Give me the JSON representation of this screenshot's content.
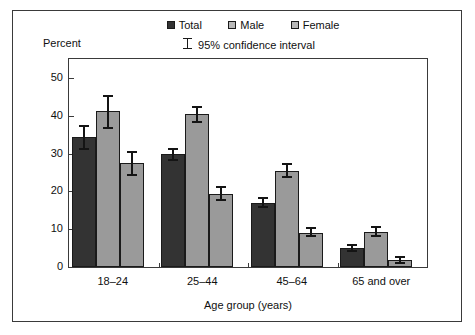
{
  "chart_data": {
    "type": "bar",
    "title": "",
    "xlabel": "Age group (years)",
    "ylabel": "Percent",
    "ylim": [
      0,
      55
    ],
    "yticks": [
      0,
      10,
      20,
      30,
      40,
      50
    ],
    "ytick_labels": [
      "0",
      "10",
      "20",
      "30",
      "40",
      "50"
    ],
    "grid": false,
    "legend_position": "top-center",
    "error_bars": "95% confidence interval",
    "categories": [
      "18–24",
      "25–44",
      "45–64",
      "65 and over"
    ],
    "series": [
      {
        "name": "Total",
        "color": "#333333",
        "values": [
          34.5,
          29.8,
          17.0,
          5.0
        ],
        "ci_low": [
          31.0,
          28.0,
          15.5,
          4.0
        ],
        "ci_high": [
          37.5,
          31.5,
          18.5,
          6.0
        ]
      },
      {
        "name": "Male",
        "color": "#9a9a9a",
        "values": [
          41.2,
          40.5,
          25.5,
          9.3
        ],
        "ci_low": [
          36.5,
          38.0,
          23.5,
          8.0
        ],
        "ci_high": [
          45.5,
          42.5,
          27.5,
          10.8
        ]
      },
      {
        "name": "Female",
        "color": "#9a9a9a",
        "values": [
          27.4,
          19.4,
          9.0,
          1.8
        ],
        "ci_low": [
          24.0,
          17.5,
          8.0,
          0.8
        ],
        "ci_high": [
          30.6,
          21.5,
          10.5,
          3.0
        ]
      }
    ]
  },
  "legend": {
    "entries": [
      {
        "label": "Total",
        "swatch": "legend-swatch-total"
      },
      {
        "label": "Male",
        "swatch": "legend-swatch-male"
      },
      {
        "label": "Female",
        "swatch": "legend-swatch-female"
      }
    ],
    "ci_label": "95% confidence interval"
  },
  "axes": {
    "y_title": "Percent",
    "x_title": "Age group (years)"
  },
  "colors": {
    "total": "#333333",
    "male": "#9a9a9a",
    "female": "#9a9a9a",
    "axis": "#3a3a3a",
    "error_bar": "#141414",
    "background": "#ffffff"
  }
}
